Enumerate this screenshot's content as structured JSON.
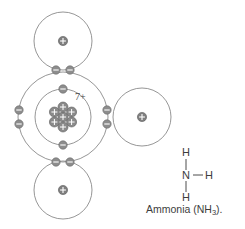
{
  "figure": {
    "caption_text": "Ammonia (NH",
    "caption_subscript": "3",
    "caption_tail": ").",
    "nucleus_charge_label": "7+",
    "colors": {
      "shell_stroke": "#8a8a8a",
      "electron_fill": "#8d8d8d",
      "nucleon_fill": "#8a8a8a",
      "bond_stroke": "#4d4d4d",
      "text": "#3d3d3d",
      "background": "#ffffff"
    }
  },
  "atoms": {
    "nitrogen": {
      "label": "nitrogen",
      "nucleus_charge": "7+",
      "inner_shell_electrons": 2,
      "outer_shell_electrons": 8,
      "nucleon_count": 7
    },
    "hydrogens": [
      {
        "label": "hydrogen-top",
        "proton_sign": "+"
      },
      {
        "label": "hydrogen-right",
        "proton_sign": "+"
      },
      {
        "label": "hydrogen-bottom",
        "proton_sign": "+"
      }
    ]
  },
  "structural_formula": {
    "top_h": "H",
    "center_n": "N",
    "right_h": "H",
    "bottom_h": "H"
  }
}
